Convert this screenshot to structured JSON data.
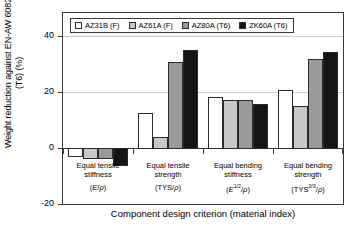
{
  "chart_data": {
    "type": "bar",
    "title": "",
    "xlabel": "Component design criterion (material index)",
    "ylabel_line1": "Weight reduction against EN-AW 6082",
    "ylabel_line2": "(T6) (%)",
    "ylim": [
      -20,
      48
    ],
    "yticks": [
      40,
      20,
      0,
      -20
    ],
    "ytick_labels": [
      "40",
      "20",
      "0",
      "-20"
    ],
    "grid": true,
    "gridlines": [
      40,
      20
    ],
    "legend_position": "top-left",
    "categories": [
      "Equal tensile stiffness",
      "Equal tensile strength",
      "Equal bending stiffness",
      "Equal bending strength"
    ],
    "category_lines": [
      [
        "Equal tensile",
        "stiffness"
      ],
      [
        "Equal tensile",
        "strength"
      ],
      [
        "Equal bending",
        "stiffness"
      ],
      [
        "Equal bending",
        "strength"
      ]
    ],
    "material_index": [
      "(E/ρ)",
      "(TYS/ρ)",
      "(E^1/2/ρ)",
      "(TYS^2/3/ρ)"
    ],
    "series": [
      {
        "name": "AZ31B (F)",
        "color": "#ffffff",
        "values": [
          -3.0,
          12.5,
          18.0,
          20.5
        ]
      },
      {
        "name": "AZ61A (F)",
        "color": "#c8c8c8",
        "values": [
          -3.5,
          4.0,
          17.0,
          15.0
        ]
      },
      {
        "name": "AZ80A (T6)",
        "color": "#9a9a9a",
        "values": [
          -3.5,
          30.5,
          17.0,
          31.5
        ]
      },
      {
        "name": "ZK60A (T6)",
        "color": "#141414",
        "values": [
          -6.0,
          35.0,
          15.5,
          34.0
        ]
      }
    ]
  },
  "legend": {
    "items": [
      {
        "label": "AZ31B (F)",
        "color": "#ffffff"
      },
      {
        "label": "AZ61A (F)",
        "color": "#c8c8c8"
      },
      {
        "label": "AZ80A (T6)",
        "color": "#9a9a9a"
      },
      {
        "label": "ZK60A (T6)",
        "color": "#141414"
      }
    ]
  },
  "axes": {
    "y_title_line1": "Weight reduction against EN-AW 6082",
    "y_title_line2": "(T6) (%)",
    "x_title": "Component design criterion (material index)"
  }
}
